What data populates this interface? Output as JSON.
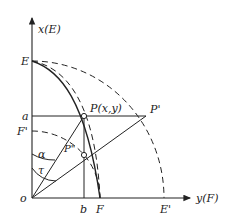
{
  "diagram": {
    "axes": {
      "vertical_label": "x(E)",
      "horizontal_label": "y(F)",
      "origin_label": "o"
    },
    "points": {
      "E": "E",
      "E_prime": "E'",
      "F": "F",
      "F_prime": "F'",
      "a": "a",
      "b": "b",
      "P": "P(x,y)",
      "P_prime": "P'",
      "P_double_prime": "P\"",
      "alpha": "α",
      "tau": "τ"
    },
    "colors": {
      "line": "#222222",
      "background": "#ffffff"
    }
  }
}
